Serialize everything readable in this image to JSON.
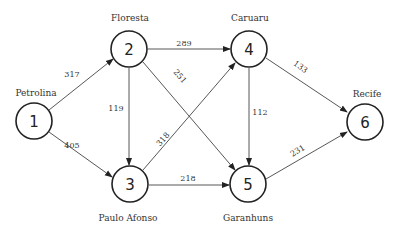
{
  "diagram": {
    "type": "directed-weighted-graph",
    "nodes": [
      {
        "id": "1",
        "label": "1",
        "city": "Petrolina",
        "x": 34,
        "y": 121
      },
      {
        "id": "2",
        "label": "2",
        "city": "Floresta",
        "x": 129,
        "y": 49
      },
      {
        "id": "3",
        "label": "3",
        "city": "Paulo Afonso",
        "x": 130,
        "y": 184
      },
      {
        "id": "4",
        "label": "4",
        "city": "Caruaru",
        "x": 249,
        "y": 49
      },
      {
        "id": "5",
        "label": "5",
        "city": "Garanhuns",
        "x": 248,
        "y": 184
      },
      {
        "id": "6",
        "label": "6",
        "city": "Recife",
        "x": 365,
        "y": 122
      }
    ],
    "edges": [
      {
        "from": "1",
        "to": "2",
        "weight": "317"
      },
      {
        "from": "1",
        "to": "3",
        "weight": "405"
      },
      {
        "from": "2",
        "to": "4",
        "weight": "289"
      },
      {
        "from": "2",
        "to": "3",
        "weight": "119"
      },
      {
        "from": "2",
        "to": "5",
        "weight": "251"
      },
      {
        "from": "3",
        "to": "4",
        "weight": "318"
      },
      {
        "from": "3",
        "to": "5",
        "weight": "218"
      },
      {
        "from": "4",
        "to": "5",
        "weight": "112"
      },
      {
        "from": "4",
        "to": "6",
        "weight": "133"
      },
      {
        "from": "5",
        "to": "6",
        "weight": "231"
      }
    ]
  }
}
